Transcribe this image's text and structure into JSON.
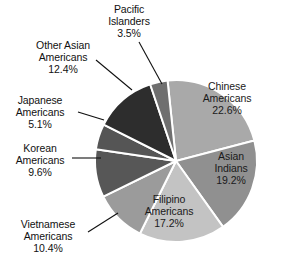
{
  "chart_data": {
    "type": "pie",
    "title": "",
    "subtitle": "",
    "xlabel": "",
    "ylabel": "",
    "legend_position": "none",
    "grid": false,
    "units": "percent",
    "categories": [
      "Chinese Americans",
      "Asian Indians",
      "Filipino Americans",
      "Vietnamese Americans",
      "Korean Americans",
      "Japanese Americans",
      "Other Asian Americans",
      "Pacific Islanders"
    ],
    "values": [
      22.6,
      19.2,
      17.2,
      10.4,
      9.6,
      5.1,
      12.4,
      3.5
    ],
    "slices": [
      {
        "name": "Chinese Americans",
        "value": 22.6,
        "label": "Chinese\nAmericans\n22.6%",
        "color": "#a9a9a9",
        "label_placement": "inside"
      },
      {
        "name": "Asian Indians",
        "value": 19.2,
        "label": "Asian\nIndians\n19.2%",
        "color": "#909090",
        "label_placement": "inside"
      },
      {
        "name": "Filipino Americans",
        "value": 17.2,
        "label": "Filipino\nAmericans\n17.2%",
        "color": "#c3c3c3",
        "label_placement": "inside"
      },
      {
        "name": "Vietnamese Americans",
        "value": 10.4,
        "label": "Vietnamese\nAmericans\n10.4%",
        "color": "#9b9b9b",
        "label_placement": "outside-leader"
      },
      {
        "name": "Korean Americans",
        "value": 9.6,
        "label": "Korean\nAmericans\n9.6%",
        "color": "#575757",
        "label_placement": "outside-leader"
      },
      {
        "name": "Japanese Americans",
        "value": 5.1,
        "label": "Japanese\nAmericans\n5.1%",
        "color": "#555555",
        "label_placement": "outside-leader"
      },
      {
        "name": "Other Asian Americans",
        "value": 12.4,
        "label": "Other Asian\nAmericans\n12.4%",
        "color": "#2d2d2d",
        "label_placement": "outside-leader"
      },
      {
        "name": "Pacific Islanders",
        "value": 3.5,
        "label": "Pacific\nIslanders\n3.5%",
        "color": "#6f6f6f",
        "label_placement": "outside-leader"
      }
    ],
    "total": 100.0,
    "start_angle_deg": -6,
    "direction": "clockwise",
    "separator_color": "#ffffff",
    "background_color": "#ffffff"
  },
  "labels": {
    "chinese": "Chinese\nAmericans\n22.6%",
    "asian_indians": "Asian\nIndians\n19.2%",
    "filipino": "Filipino\nAmericans\n17.2%",
    "vietnamese": "Vietnamese\nAmericans\n10.4%",
    "korean": "Korean\nAmericans\n9.6%",
    "japanese": "Japanese\nAmericans\n5.1%",
    "other_asian": "Other Asian\nAmericans\n12.4%",
    "pacific": "Pacific\nIslanders\n3.5%"
  }
}
